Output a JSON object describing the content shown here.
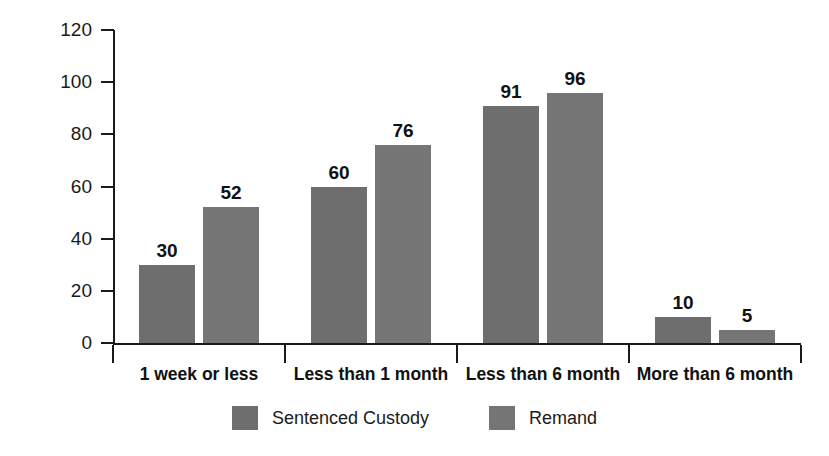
{
  "chart_data": {
    "type": "bar",
    "title": "",
    "subtitle": "",
    "xlabel": "",
    "ylabel": "per cent",
    "ylim": [
      0,
      120
    ],
    "yticks": [
      0,
      20,
      40,
      60,
      80,
      100,
      120
    ],
    "grid": false,
    "legend_position": "bottom-center",
    "categories": [
      "1 week or less",
      "Less than 1 month",
      "Less than 6 month",
      "More than 6 month"
    ],
    "series": [
      {
        "name": "Sentenced Custody",
        "color": "#6e6e6e",
        "values": [
          30,
          60,
          91,
          10
        ]
      },
      {
        "name": "Remand",
        "color": "#757575",
        "values": [
          52,
          76,
          96,
          5
        ]
      }
    ],
    "data_labels": [
      [
        "30",
        "52"
      ],
      [
        "60",
        "76"
      ],
      [
        "91",
        "96"
      ],
      [
        "10",
        "5"
      ]
    ]
  },
  "axis": {
    "y_tick_labels": [
      "120",
      "100",
      "80",
      "60",
      "40",
      "20",
      "0"
    ],
    "y_title": "per cent"
  },
  "legend": {
    "items": [
      {
        "label": "Sentenced Custody",
        "color": "#6e6e6e"
      },
      {
        "label": "Remand",
        "color": "#757575"
      }
    ]
  },
  "colors": {
    "axis": "#1a1a1a",
    "text": "#1a1a1a",
    "background": "#ffffff",
    "series_1": "#6e6e6e",
    "series_2": "#757575"
  }
}
